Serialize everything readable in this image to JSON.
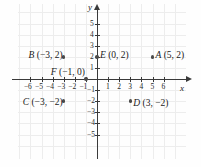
{
  "figure": {
    "type": "coordinate-plane",
    "x_axis_label": "x",
    "y_axis_label": "y",
    "x_ticks": [
      -6,
      -5,
      -4,
      -3,
      -2,
      -1,
      1,
      2,
      3,
      4,
      5,
      6
    ],
    "y_ticks": [
      5,
      4,
      3,
      2,
      1,
      -1,
      -2,
      -3,
      -4,
      -5
    ],
    "x_tick_labels": [
      "−6",
      "−5",
      "−4",
      "−3",
      "−2",
      "−1",
      "1",
      "2",
      "3",
      "4",
      "5",
      "6"
    ],
    "y_tick_labels": [
      "5",
      "4",
      "3",
      "2",
      "1",
      "−1",
      "−2",
      "−3",
      "−4",
      "−5"
    ],
    "grid": true,
    "xlim": [
      -7,
      7
    ],
    "ylim": [
      -6,
      6
    ],
    "colors": {
      "axis": "#3a3a3a",
      "grid": "#ededed",
      "point": "#4b4b4b",
      "text": "#1a1a1a",
      "background": "#fefefe"
    }
  },
  "chart_data": {
    "type": "scatter",
    "title": "",
    "xlabel": "x",
    "ylabel": "y",
    "xlim": [
      -7,
      7
    ],
    "ylim": [
      -6,
      6
    ],
    "grid": true,
    "points": [
      {
        "name": "A",
        "x": 5,
        "y": 2,
        "label": "A (5, 2)",
        "label_pos": "right"
      },
      {
        "name": "B",
        "x": -3,
        "y": 2,
        "label": "B (−3, 2)",
        "label_pos": "left"
      },
      {
        "name": "C",
        "x": -3,
        "y": -2,
        "label": "C (−3, −2)",
        "label_pos": "left"
      },
      {
        "name": "D",
        "x": 3,
        "y": -2,
        "label": "D (3, −2)",
        "label_pos": "right"
      },
      {
        "name": "E",
        "x": 0,
        "y": 2,
        "label": "E (0, 2)",
        "label_pos": "right"
      },
      {
        "name": "F",
        "x": -1,
        "y": 0,
        "label": "F (−1, 0)",
        "label_pos": "left"
      }
    ]
  },
  "labels": {
    "point_a": "A (5, 2)",
    "point_b": "B (−3, 2)",
    "point_c": "C (−3, −2)",
    "point_d": "D (3, −2)",
    "point_e": "E (0, 2)",
    "point_f": "F (−1, 0)"
  }
}
